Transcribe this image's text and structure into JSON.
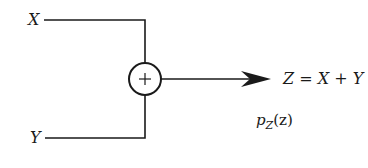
{
  "diagram": {
    "type": "signal-adder-block",
    "inputs": [
      {
        "id": "x",
        "label": "X"
      },
      {
        "id": "y",
        "label": "Y"
      }
    ],
    "operator": {
      "symbol": "+",
      "shape": "circle"
    },
    "output": {
      "label": "Z = X + Y"
    },
    "output_pdf": {
      "label": "p_Z(z)",
      "base": "p",
      "subscript": "Z",
      "arg": "(z)"
    },
    "colors": {
      "stroke": "#1a1a1a",
      "background": "#ffffff"
    }
  }
}
